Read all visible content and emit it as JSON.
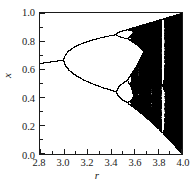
{
  "chart_data": {
    "type": "scatter",
    "title": "",
    "subtitle": "",
    "xlabel": "r",
    "ylabel": "x",
    "xlim": [
      2.8,
      4.0
    ],
    "ylim": [
      0.0,
      1.0
    ],
    "grid": false,
    "legend": null,
    "equation": "x_{n+1} = r x_n (1 - x_n)",
    "x_ticks": [
      2.8,
      3.0,
      3.2,
      3.4,
      3.6,
      3.8,
      4.0
    ],
    "x_tick_labels": [
      "2.8",
      "3.0",
      "3.2",
      "3.4",
      "3.6",
      "3.8",
      "4.0"
    ],
    "x_minor_ticks": [
      2.9,
      3.1,
      3.3,
      3.5,
      3.7,
      3.9
    ],
    "y_ticks": [
      0.0,
      0.2,
      0.4,
      0.6,
      0.8,
      1.0
    ],
    "y_tick_labels": [
      "0.0",
      "0.2",
      "0.4",
      "0.6",
      "0.8",
      "1.0"
    ],
    "y_minor_ticks": [
      0.1,
      0.3,
      0.5,
      0.7,
      0.9
    ],
    "point_color": "#000000",
    "background_color": "#ffffff",
    "axis_color": "#1a1a1a",
    "features": {
      "period_1_range": [
        2.8,
        3.0
      ],
      "period_1_start_value": 0.643,
      "period_1_end_value": 0.667,
      "period_2_onset": 3.0,
      "period_4_onset": 3.449,
      "period_8_onset": 3.544,
      "period_16_onset": 3.5644,
      "chaos_onset": 3.5699,
      "period_3_window": [
        3.828,
        3.857
      ],
      "period_5_window": [
        3.738,
        3.745
      ],
      "period_6_window": [
        3.627,
        3.635
      ],
      "upper_envelope_at_4": 1.0,
      "lower_envelope_at_4": 0.0
    },
    "simulation": {
      "r_steps": 1420,
      "transient_iterations": 320,
      "plotted_iterations": 320,
      "x0": 0.35
    }
  },
  "axes": {
    "y_title": "x",
    "x_title": "r"
  }
}
